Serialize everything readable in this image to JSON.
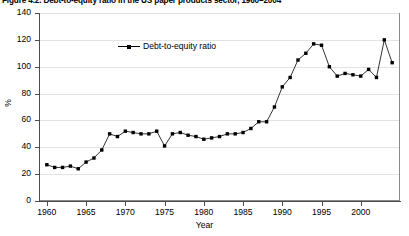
{
  "figure": {
    "title": "Figure 4.2. Debt-to-equity ratio in the US paper products sector, 1960–2004"
  },
  "axes": {
    "y_title": "%",
    "x_title": "Year",
    "y_ticks": [
      "0",
      "20",
      "40",
      "60",
      "80",
      "100",
      "120",
      "140"
    ],
    "x_ticks": [
      "1960",
      "1965",
      "1970",
      "1975",
      "1980",
      "1985",
      "1990",
      "1995",
      "2000"
    ]
  },
  "legend": {
    "entries": [
      {
        "label": "Debt-to-equity ratio",
        "marker": "filled-square",
        "color": "#000000"
      }
    ]
  },
  "colors": {
    "series": "#000000",
    "grid": "#e2e2e2",
    "axis": "#4d4d4d",
    "frame": "#8a8a8a",
    "background": "#ffffff"
  },
  "chart_data": {
    "type": "line",
    "title": "Figure 4.2. Debt-to-equity ratio in the US paper products sector, 1960–2004",
    "xlabel": "Year",
    "ylabel": "%",
    "xlim": [
      1959,
      2005
    ],
    "ylim": [
      0,
      140
    ],
    "grid": true,
    "legend_position": "top-center-inside",
    "x": [
      1960,
      1961,
      1962,
      1963,
      1964,
      1965,
      1966,
      1967,
      1968,
      1969,
      1970,
      1971,
      1972,
      1973,
      1974,
      1975,
      1976,
      1977,
      1978,
      1979,
      1980,
      1981,
      1982,
      1983,
      1984,
      1985,
      1986,
      1987,
      1988,
      1989,
      1990,
      1991,
      1992,
      1993,
      1994,
      1995,
      1996,
      1997,
      1998,
      1999,
      2000,
      2001,
      2002,
      2003,
      2004
    ],
    "series": [
      {
        "name": "Debt-to-equity ratio",
        "marker": "filled-square",
        "color": "#000000",
        "values": [
          27,
          25,
          25,
          26,
          24,
          29,
          32,
          38,
          50,
          48,
          52,
          51,
          50,
          50,
          52,
          41,
          50,
          51,
          49,
          48,
          46,
          47,
          48,
          50,
          50,
          51,
          54,
          59,
          59,
          70,
          85,
          92,
          105,
          110,
          117,
          116,
          100,
          93,
          95,
          94,
          93,
          98,
          92,
          120,
          103
        ]
      }
    ]
  }
}
